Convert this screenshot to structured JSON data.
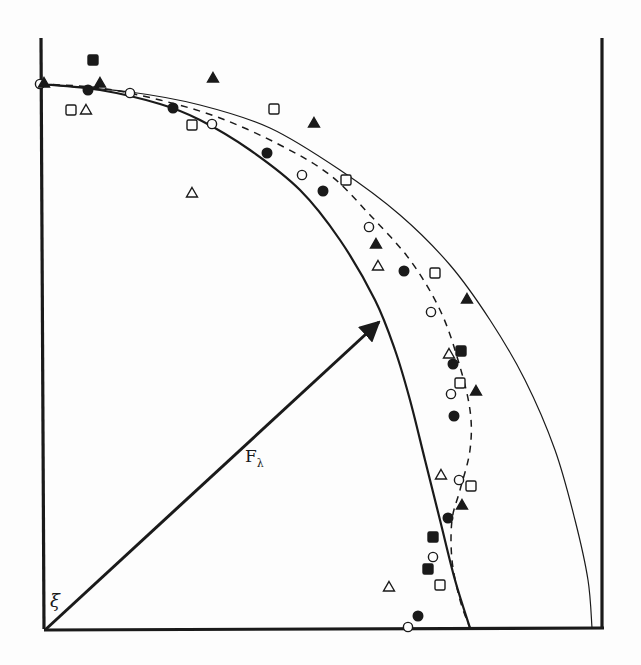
{
  "chart_data": {
    "type": "scatter",
    "title": "",
    "xlabel": "",
    "ylabel": "",
    "grid": false,
    "legend": null,
    "annotations": {
      "origin_label": "ξ",
      "vector_label": "F",
      "vector_subscript": "λ"
    },
    "frame": {
      "left_x": 41,
      "right_x": 602,
      "top_y": 38,
      "bottom_y": 629,
      "origin": [
        45,
        630
      ]
    },
    "vector": {
      "from": [
        45,
        630
      ],
      "to": [
        379,
        322
      ]
    },
    "curves": [
      {
        "name": "inner-solid-curve",
        "style": "solid-thick",
        "points": [
          [
            40,
            84
          ],
          [
            100,
            90
          ],
          [
            160,
            104
          ],
          [
            200,
            120
          ],
          [
            250,
            150
          ],
          [
            300,
            190
          ],
          [
            340,
            240
          ],
          [
            375,
            300
          ],
          [
            395,
            350
          ],
          [
            410,
            400
          ],
          [
            425,
            460
          ],
          [
            440,
            520
          ],
          [
            455,
            580
          ],
          [
            470,
            628
          ]
        ]
      },
      {
        "name": "dashed-curve",
        "style": "dashed",
        "points": [
          [
            40,
            84
          ],
          [
            100,
            88
          ],
          [
            160,
            100
          ],
          [
            220,
            118
          ],
          [
            280,
            145
          ],
          [
            330,
            175
          ],
          [
            370,
            215
          ],
          [
            410,
            260
          ],
          [
            440,
            310
          ],
          [
            458,
            360
          ],
          [
            470,
            410
          ],
          [
            470,
            450
          ],
          [
            460,
            490
          ],
          [
            452,
            520
          ],
          [
            452,
            560
          ],
          [
            460,
            600
          ],
          [
            470,
            628
          ]
        ]
      },
      {
        "name": "outer-thin-curve",
        "style": "solid-thin",
        "points": [
          [
            40,
            84
          ],
          [
            130,
            92
          ],
          [
            200,
            105
          ],
          [
            270,
            128
          ],
          [
            340,
            170
          ],
          [
            400,
            215
          ],
          [
            450,
            265
          ],
          [
            490,
            320
          ],
          [
            525,
            380
          ],
          [
            555,
            450
          ],
          [
            575,
            520
          ],
          [
            588,
            580
          ],
          [
            592,
            628
          ]
        ]
      }
    ],
    "series": [
      {
        "name": "open-circle",
        "marker": "circle-open",
        "points": [
          [
            40,
            84
          ],
          [
            130,
            93
          ],
          [
            212,
            124
          ],
          [
            302,
            175
          ],
          [
            369,
            227
          ],
          [
            431,
            312
          ],
          [
            451,
            394
          ],
          [
            459,
            480
          ],
          [
            433,
            557
          ],
          [
            408,
            627
          ]
        ]
      },
      {
        "name": "filled-circle",
        "marker": "circle-filled",
        "points": [
          [
            88,
            90
          ],
          [
            173,
            108
          ],
          [
            267,
            153
          ],
          [
            323,
            191
          ],
          [
            404,
            271
          ],
          [
            453,
            364
          ],
          [
            454,
            416
          ],
          [
            448,
            518
          ],
          [
            418,
            616
          ]
        ]
      },
      {
        "name": "open-square",
        "marker": "square-open",
        "points": [
          [
            71,
            110
          ],
          [
            192,
            125
          ],
          [
            274,
            109
          ],
          [
            346,
            180
          ],
          [
            435,
            273
          ],
          [
            460,
            383
          ],
          [
            471,
            486
          ],
          [
            440,
            585
          ]
        ]
      },
      {
        "name": "filled-square",
        "marker": "square-filled",
        "points": [
          [
            93,
            60
          ],
          [
            461,
            351
          ],
          [
            433,
            537
          ],
          [
            428,
            569
          ]
        ]
      },
      {
        "name": "open-triangle",
        "marker": "triangle-open",
        "points": [
          [
            86,
            110
          ],
          [
            192,
            193
          ],
          [
            378,
            266
          ],
          [
            449,
            354
          ],
          [
            441,
            475
          ],
          [
            389,
            587
          ]
        ]
      },
      {
        "name": "filled-triangle",
        "marker": "triangle-filled",
        "points": [
          [
            44,
            83
          ],
          [
            100,
            83
          ],
          [
            213,
            78
          ],
          [
            314,
            123
          ],
          [
            376,
            244
          ],
          [
            467,
            299
          ],
          [
            476,
            391
          ],
          [
            462,
            505
          ]
        ]
      }
    ]
  }
}
